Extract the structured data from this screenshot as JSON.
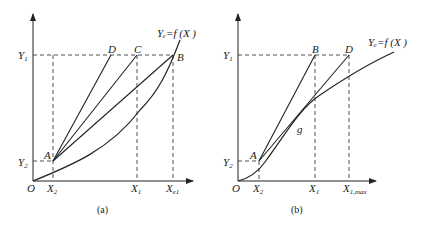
{
  "figures": [
    {
      "id": "a",
      "caption": "(a)",
      "curve_label": "Yₑ=f (X )",
      "origin_label": "O",
      "y_ticks": [
        {
          "main": "Y",
          "sub": "1"
        },
        {
          "main": "Y",
          "sub": "2"
        }
      ],
      "x_ticks": [
        {
          "main": "X",
          "sub": "2"
        },
        {
          "main": "X",
          "sub": "1"
        },
        {
          "main": "X",
          "sub": "e1"
        }
      ],
      "points": [
        "A",
        "B",
        "C",
        "D"
      ]
    },
    {
      "id": "b",
      "caption": "(b)",
      "curve_label": "Yₑ=f (X )",
      "origin_label": "O",
      "y_ticks": [
        {
          "main": "Y",
          "sub": "1"
        },
        {
          "main": "Y",
          "sub": "2"
        }
      ],
      "x_ticks": [
        {
          "main": "X",
          "sub": "2"
        },
        {
          "main": "X",
          "sub": "1"
        },
        {
          "main": "X",
          "sub": "1,max"
        }
      ],
      "points": [
        "A",
        "B",
        "D",
        "g"
      ]
    }
  ],
  "colors": {
    "line": "#222222",
    "background": "#ffffff"
  }
}
